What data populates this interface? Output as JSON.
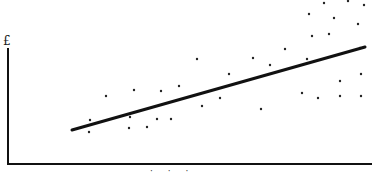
{
  "chart_data": {
    "type": "scatter",
    "title": "",
    "xlabel": "",
    "ylabel": "£",
    "xlim": [
      0,
      100
    ],
    "ylim": [
      0,
      100
    ],
    "grid": false,
    "legend": null,
    "axes_px": {
      "x0": 8,
      "y0": 164,
      "x1": 372,
      "ytop": 48
    },
    "points_px": [
      [
        89,
        132
      ],
      [
        90,
        120
      ],
      [
        106,
        96
      ],
      [
        134,
        90
      ],
      [
        130,
        117
      ],
      [
        129,
        128
      ],
      [
        147,
        127
      ],
      [
        157,
        119
      ],
      [
        161,
        91
      ],
      [
        171,
        119
      ],
      [
        179,
        86
      ],
      [
        197,
        59
      ],
      [
        202,
        106
      ],
      [
        220,
        98
      ],
      [
        229,
        74
      ],
      [
        253,
        58
      ],
      [
        261,
        109
      ],
      [
        270,
        65
      ],
      [
        285,
        49
      ],
      [
        302,
        93
      ],
      [
        307,
        59
      ],
      [
        309,
        14
      ],
      [
        312,
        36
      ],
      [
        318,
        98
      ],
      [
        324,
        3
      ],
      [
        329,
        34
      ],
      [
        334,
        18
      ],
      [
        340,
        81
      ],
      [
        340,
        96
      ],
      [
        348,
        1
      ],
      [
        358,
        24
      ],
      [
        360,
        48
      ],
      [
        361,
        74
      ],
      [
        361,
        96
      ],
      [
        364,
        5
      ]
    ],
    "trend_line_px": {
      "x1": 72,
      "y1": 130,
      "x2": 365,
      "y2": 47
    },
    "annotations": [
      "£"
    ],
    "colors": {
      "points": "#222222",
      "line": "#111111",
      "axes": "#111111"
    }
  },
  "labels": {
    "y_axis": "£",
    "x_axis_partial": "· · ·"
  }
}
